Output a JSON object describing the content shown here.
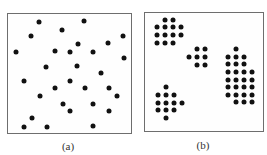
{
  "figure": {
    "panels": [
      {
        "id": "a",
        "label": "(a)",
        "description": "random scattered points",
        "box": {
          "left": 7,
          "top": 13,
          "right": 132,
          "bottom": 134
        },
        "label_pos": {
          "x": 68,
          "y": 140
        },
        "points": [
          [
            39,
            22
          ],
          [
            84,
            21
          ],
          [
            62,
            30
          ],
          [
            31,
            36
          ],
          [
            123,
            36
          ],
          [
            78,
            44
          ],
          [
            108,
            43
          ],
          [
            16,
            52
          ],
          [
            55,
            51
          ],
          [
            70,
            52
          ],
          [
            93,
            52
          ],
          [
            124,
            58
          ],
          [
            46,
            67
          ],
          [
            77,
            66
          ],
          [
            101,
            73
          ],
          [
            24,
            81
          ],
          [
            70,
            81
          ],
          [
            55,
            88
          ],
          [
            85,
            88
          ],
          [
            109,
            88
          ],
          [
            40,
            96
          ],
          [
            117,
            96
          ],
          [
            63,
            104
          ],
          [
            93,
            104
          ],
          [
            70,
            111
          ],
          [
            109,
            111
          ],
          [
            32,
            118
          ],
          [
            24,
            127
          ],
          [
            47,
            127
          ],
          [
            93,
            126
          ]
        ]
      },
      {
        "id": "b",
        "label": "(b)",
        "description": "clustered points",
        "box": {
          "left": 144,
          "top": 12,
          "right": 264,
          "bottom": 132
        },
        "label_pos": {
          "x": 203,
          "y": 139
        },
        "points": [
          [
            165,
            20
          ],
          [
            173,
            20
          ],
          [
            157,
            27
          ],
          [
            165,
            27
          ],
          [
            173,
            27
          ],
          [
            181,
            27
          ],
          [
            157,
            35
          ],
          [
            165,
            35
          ],
          [
            173,
            35
          ],
          [
            181,
            35
          ],
          [
            157,
            43
          ],
          [
            165,
            43
          ],
          [
            173,
            43
          ],
          [
            197,
            49
          ],
          [
            205,
            49
          ],
          [
            189,
            57
          ],
          [
            197,
            57
          ],
          [
            205,
            57
          ],
          [
            197,
            65
          ],
          [
            205,
            65
          ],
          [
            236,
            49
          ],
          [
            228,
            57
          ],
          [
            236,
            57
          ],
          [
            244,
            57
          ],
          [
            228,
            64
          ],
          [
            236,
            64
          ],
          [
            244,
            64
          ],
          [
            228,
            72
          ],
          [
            236,
            72
          ],
          [
            244,
            72
          ],
          [
            252,
            72
          ],
          [
            228,
            80
          ],
          [
            236,
            80
          ],
          [
            244,
            80
          ],
          [
            252,
            80
          ],
          [
            228,
            87
          ],
          [
            236,
            87
          ],
          [
            244,
            87
          ],
          [
            252,
            87
          ],
          [
            228,
            95
          ],
          [
            236,
            95
          ],
          [
            244,
            95
          ],
          [
            252,
            95
          ],
          [
            236,
            102
          ],
          [
            244,
            102
          ],
          [
            252,
            102
          ],
          [
            166,
            87
          ],
          [
            158,
            95
          ],
          [
            166,
            95
          ],
          [
            174,
            95
          ],
          [
            158,
            103
          ],
          [
            166,
            103
          ],
          [
            174,
            103
          ],
          [
            182,
            103
          ],
          [
            158,
            110
          ],
          [
            166,
            110
          ],
          [
            174,
            110
          ],
          [
            166,
            118
          ]
        ]
      }
    ],
    "colors": {
      "dot": "#111111",
      "frame": "#6e6e6e",
      "background": "#ffffff"
    }
  }
}
